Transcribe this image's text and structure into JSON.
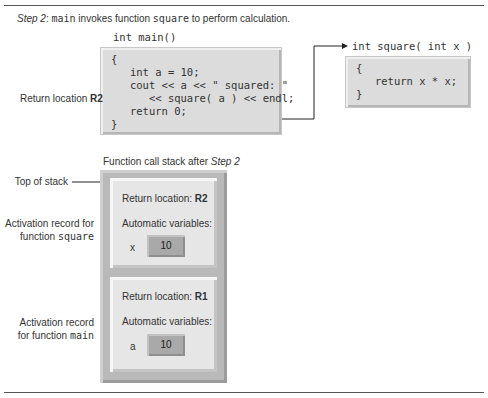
{
  "caption": {
    "step_label": "Step 2",
    "sep": ": ",
    "fn_main": "main",
    "text1": " invokes function ",
    "fn_square": "square",
    "text2": " to perform calculation."
  },
  "main_code": {
    "title": "int main()",
    "lines": [
      "{",
      "   int a = 10;",
      "   cout << a << \" squared: \"",
      "      << square( a ) << endl;",
      "   return 0;",
      "}"
    ]
  },
  "square_code": {
    "title": "int square( int x )",
    "lines": [
      "{",
      "   return x * x;",
      "}"
    ]
  },
  "return_location_label": {
    "text": "Return location ",
    "value": "R2"
  },
  "stack": {
    "caption_prefix": "Function call stack after ",
    "caption_step": "Step 2",
    "top_label": "Top of stack",
    "records": [
      {
        "label_line1": "Activation record for",
        "label_line2_prefix": "function ",
        "label_fn": "square",
        "return_prefix": "Return location: ",
        "return_value": "R2",
        "auto_vars_label": "Automatic variables:",
        "var_name": "x",
        "var_value": "10"
      },
      {
        "label_line1": "Activation record",
        "label_line2_prefix": "for function ",
        "label_fn": "main",
        "return_prefix": "Return location: ",
        "return_value": "R1",
        "auto_vars_label": "Automatic variables:",
        "var_name": "a",
        "var_value": "10"
      }
    ]
  },
  "colors": {
    "code_box": "#dcdcdc",
    "stack_outer": "#b9b9b9",
    "record_bg": "#e6e6e6",
    "var_box": "#a9a9a9",
    "text": "#333333"
  }
}
